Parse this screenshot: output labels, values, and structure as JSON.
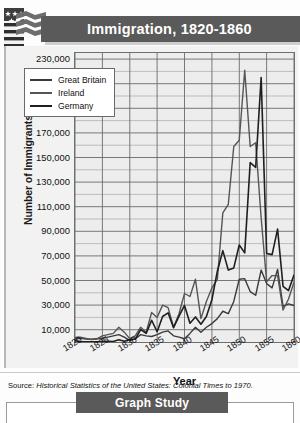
{
  "banner": {
    "title": "Immigration, 1820-1860",
    "flag_icon": "american-flag-icon",
    "bar_color": "#5a5a5a"
  },
  "chart_data": {
    "type": "line",
    "title": "Immigration, 1820-1860",
    "xlabel": "Year",
    "ylabel": "Number of Immigrants",
    "xlim": [
      1820,
      1860
    ],
    "ylim": [
      0,
      235000
    ],
    "grid": true,
    "legend_position": "top-left",
    "ytick_labels": [
      "230,000",
      "210,000",
      "190,000",
      "170,000",
      "150,000",
      "130,000",
      "110,000",
      "90,000",
      "70,000",
      "50,000",
      "30,000",
      "10,000"
    ],
    "ytick_values": [
      230000,
      210000,
      190000,
      170000,
      150000,
      130000,
      110000,
      90000,
      70000,
      50000,
      30000,
      10000
    ],
    "xtick_labels": [
      "1820",
      "1825",
      "1830",
      "1835",
      "1840",
      "1845",
      "1850",
      "1855",
      "1860"
    ],
    "xtick_values": [
      1820,
      1825,
      1830,
      1835,
      1840,
      1845,
      1850,
      1855,
      1860
    ],
    "x": [
      1820,
      1821,
      1822,
      1823,
      1824,
      1825,
      1826,
      1827,
      1828,
      1829,
      1830,
      1831,
      1832,
      1833,
      1834,
      1835,
      1836,
      1837,
      1838,
      1839,
      1840,
      1841,
      1842,
      1843,
      1844,
      1845,
      1846,
      1847,
      1848,
      1849,
      1850,
      1851,
      1852,
      1853,
      1854,
      1855,
      1856,
      1857,
      1858,
      1859,
      1860
    ],
    "series": [
      {
        "name": "Great Britain",
        "color": "#3a3a3a",
        "values": [
          2410,
          3000,
          2500,
          2200,
          2600,
          3000,
          4000,
          5000,
          6000,
          4000,
          1150,
          2500,
          6000,
          5000,
          4500,
          6000,
          8000,
          9000,
          5000,
          4000,
          2610,
          7000,
          12000,
          8000,
          12000,
          15000,
          19000,
          25000,
          23000,
          33000,
          51000,
          51500,
          41000,
          38000,
          58500,
          47500,
          44000,
          59000,
          29000,
          31000,
          29700
        ],
        "linewidth": 1.4
      },
      {
        "name": "Ireland",
        "color": "#555555",
        "values": [
          3610,
          4000,
          3000,
          2000,
          2500,
          5000,
          6000,
          7000,
          12000,
          8000,
          2720,
          5000,
          12000,
          8000,
          24000,
          20000,
          30000,
          28000,
          12000,
          23000,
          39430,
          37000,
          51000,
          19000,
          33000,
          44000,
          51000,
          105000,
          112000,
          159000,
          164000,
          221000,
          159000,
          162000,
          101000,
          49000,
          54000,
          54000,
          26000,
          35000,
          48600
        ],
        "linewidth": 1.4
      },
      {
        "name": "Germany",
        "color": "#1f1f1f",
        "values": [
          968,
          400,
          150,
          180,
          230,
          450,
          500,
          430,
          1850,
          600,
          1976,
          2400,
          10000,
          6988,
          17686,
          8311,
          20707,
          23740,
          11683,
          21028,
          29704,
          15291,
          20370,
          14441,
          20731,
          34355,
          57561,
          74281,
          58465,
          60235,
          78896,
          72482,
          145918,
          141946,
          215009,
          71918,
          71028,
          91781,
          45310,
          41784,
          54491
        ],
        "linewidth": 1.6
      }
    ],
    "peaks": [
      {
        "series": "Ireland",
        "year": 1851,
        "value": 221000
      },
      {
        "series": "Germany",
        "year": 1854,
        "value": 215009
      }
    ]
  },
  "legend": {
    "items": [
      {
        "label": "Great Britain"
      },
      {
        "label": "Ireland"
      },
      {
        "label": "Germany"
      }
    ]
  },
  "source": {
    "prefix": "Source:",
    "text": "Historical Statistics of the United States: Colonial Times to 1970."
  },
  "footer": {
    "graph_study_label": "Graph Study"
  }
}
